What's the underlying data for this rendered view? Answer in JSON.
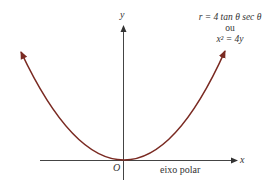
{
  "diagram": {
    "equation_polar": "r = 4 tan θ sec θ",
    "connector": "ou",
    "equation_cartesian": "x² = 4y",
    "axis_x_label": "x",
    "axis_y_label": "y",
    "origin_label": "O",
    "polar_axis_label": "eixo polar",
    "curve_color": "#7a2a22",
    "axis_color": "#333333"
  }
}
